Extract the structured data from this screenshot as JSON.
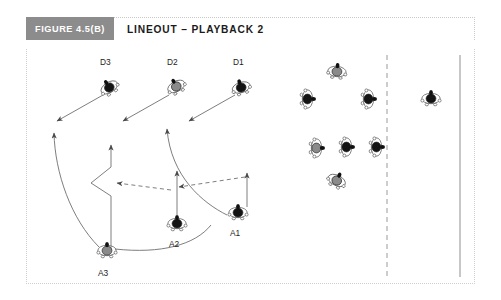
{
  "header": {
    "badge": "FIGURE 4.5(B)",
    "title": "LINEOUT – PLAYBACK 2"
  },
  "colors": {
    "badge_bg": "#8c8c8c",
    "badge_text": "#ffffff",
    "title_text": "#1a1a1a",
    "frame_border": "#cfcfcf",
    "page_bg": "#ffffff",
    "line": "#6f6f6f",
    "attack_jersey": "#141414",
    "defence_jersey": "#141414",
    "grey_jersey": "#8a8a8a",
    "white_jersey": "#ffffff",
    "label_text": "#1d1d1d"
  },
  "diagram": {
    "name": "rugby-lineout-playback-2",
    "field_lines": [
      {
        "name": "dashed-vertical-line",
        "style": "dashed",
        "x": 360,
        "y1": 6,
        "y2": 228
      },
      {
        "name": "solid-vertical-line",
        "style": "solid",
        "x": 433,
        "y1": 6,
        "y2": 228
      }
    ],
    "labels": [
      {
        "name": "player-label-d3",
        "text": "D3",
        "x": 73,
        "y": 8
      },
      {
        "name": "player-label-d2",
        "text": "D2",
        "x": 140,
        "y": 8
      },
      {
        "name": "player-label-d1",
        "text": "D1",
        "x": 206,
        "y": 8
      },
      {
        "name": "player-label-a1",
        "text": "A1",
        "x": 203,
        "y": 179
      },
      {
        "name": "player-label-a2",
        "text": "A2",
        "x": 142,
        "y": 190
      },
      {
        "name": "player-label-a3",
        "text": "A3",
        "x": 71,
        "y": 219
      }
    ],
    "players": [
      {
        "name": "player-d3",
        "team": "defence",
        "x": 82,
        "y": 38,
        "rot": -32,
        "jersey": "dark",
        "label": "D3"
      },
      {
        "name": "player-d2",
        "team": "defence",
        "x": 149,
        "y": 37,
        "rot": -28,
        "jersey": "grey",
        "label": "D2"
      },
      {
        "name": "player-d1",
        "team": "defence",
        "x": 214,
        "y": 38,
        "rot": -18,
        "jersey": "dark",
        "label": "D1"
      },
      {
        "name": "player-a1",
        "team": "attack",
        "x": 211,
        "y": 163,
        "rot": 0,
        "jersey": "dark",
        "label": "A1"
      },
      {
        "name": "player-a2",
        "team": "attack",
        "x": 150,
        "y": 174,
        "rot": 0,
        "jersey": "dark",
        "label": "A2"
      },
      {
        "name": "player-a3",
        "team": "attack",
        "x": 80,
        "y": 201,
        "rot": 0,
        "jersey": "grey",
        "label": "A3"
      },
      {
        "name": "player-pod-top",
        "team": "defence",
        "x": 310,
        "y": 22,
        "rot": 6,
        "jersey": "grey",
        "label": ""
      },
      {
        "name": "player-pod-left",
        "team": "defence",
        "x": 281,
        "y": 50,
        "rot": 90,
        "jersey": "dark",
        "label": ""
      },
      {
        "name": "player-pod-right",
        "team": "defence",
        "x": 342,
        "y": 50,
        "rot": 90,
        "jersey": "dark",
        "label": ""
      },
      {
        "name": "player-line-left",
        "team": "attack",
        "x": 290,
        "y": 99,
        "rot": 90,
        "jersey": "grey",
        "label": ""
      },
      {
        "name": "player-line-middle",
        "team": "attack",
        "x": 320,
        "y": 98,
        "rot": 90,
        "jersey": "dark",
        "label": ""
      },
      {
        "name": "player-line-right",
        "team": "attack",
        "x": 350,
        "y": 98,
        "rot": 90,
        "jersey": "dark",
        "label": ""
      },
      {
        "name": "player-scrumhalf",
        "team": "attack",
        "x": 310,
        "y": 131,
        "rot": 26,
        "jersey": "grey",
        "label": ""
      },
      {
        "name": "player-far-right",
        "team": "defence",
        "x": 404,
        "y": 49,
        "rot": 0,
        "jersey": "dark",
        "label": ""
      }
    ],
    "movement_paths": [
      {
        "name": "run-path-a3-to-d3-channel",
        "style": "solid-curve",
        "arrow": "end"
      },
      {
        "name": "run-path-a3-to-centre",
        "style": "solid-curve",
        "arrow": "end"
      },
      {
        "name": "run-path-a2-kink",
        "style": "solid-polyline",
        "arrow": "end"
      },
      {
        "name": "run-path-a2-straight-up",
        "style": "solid-line",
        "arrow": "end"
      },
      {
        "name": "run-path-a1-to-d2-channel",
        "style": "solid-curve",
        "arrow": "end"
      },
      {
        "name": "run-path-a1-up",
        "style": "solid-line",
        "arrow": "end"
      },
      {
        "name": "pass-line-right-to-centre",
        "style": "dashed-line",
        "arrow": "end"
      },
      {
        "name": "pass-line-centre-to-left",
        "style": "dashed-line",
        "arrow": "end"
      },
      {
        "name": "tackle-arrow-d3",
        "style": "solid-line",
        "arrow": "end"
      },
      {
        "name": "tackle-arrow-d2",
        "style": "solid-line",
        "arrow": "end"
      },
      {
        "name": "tackle-arrow-d1",
        "style": "solid-line",
        "arrow": "end"
      }
    ]
  }
}
